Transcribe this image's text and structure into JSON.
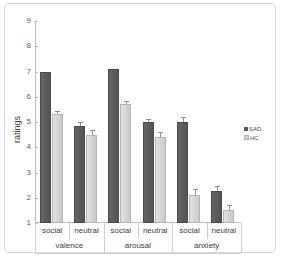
{
  "chart_data": {
    "type": "bar",
    "title": "",
    "xlabel": "",
    "ylabel": "ratings",
    "ylim": [
      1,
      9
    ],
    "ytick_labels": [
      "9",
      "8",
      "7",
      "6",
      "5",
      "4",
      "3",
      "2",
      "1"
    ],
    "ytick_values": [
      9,
      8,
      7,
      6,
      5,
      4,
      3,
      2,
      1
    ],
    "grid": false,
    "legend_position": "right",
    "groups": [
      "valence",
      "arousal",
      "anxiety"
    ],
    "categories": [
      "social",
      "neutral",
      "social",
      "neutral",
      "social",
      "neutral"
    ],
    "series": [
      {
        "name": "SAD",
        "color": "#595959",
        "values": [
          7.0,
          4.85,
          7.1,
          5.0,
          5.0,
          2.25
        ],
        "errors": [
          0.0,
          0.15,
          0.0,
          0.1,
          0.2,
          0.2
        ]
      },
      {
        "name": "HC",
        "color": "#d2d2d2",
        "values": [
          5.3,
          4.5,
          5.7,
          4.4,
          2.1,
          1.5
        ],
        "errors": [
          0.15,
          0.2,
          0.15,
          0.2,
          0.25,
          0.2
        ]
      }
    ],
    "legend": [
      {
        "label": "SAD",
        "color": "#595959"
      },
      {
        "label": "HC",
        "color": "#d2d2d2"
      }
    ]
  }
}
